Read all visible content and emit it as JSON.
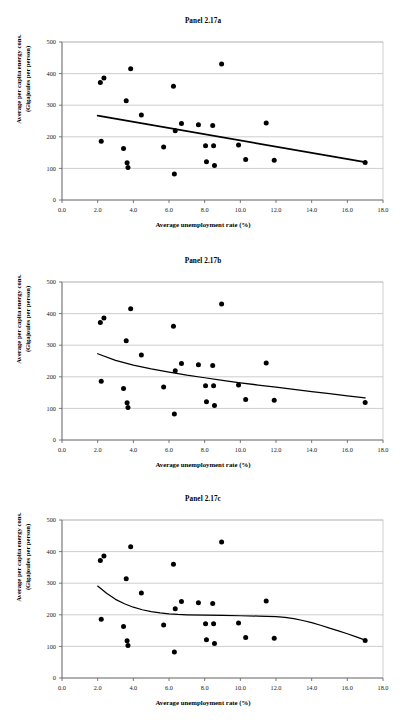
{
  "document": {
    "figure_label": "Panel 2.17",
    "panel_count": 3
  },
  "axes": {
    "xlabel": "Average unemployment rate (%)",
    "ylabel_line1": "Average per capita energy cons.",
    "ylabel_line2": "(Gigajoules per person)",
    "xticks": [
      "0.0",
      "2.0",
      "4.0",
      "6.0",
      "8.0",
      "10.0",
      "12.0",
      "14.0",
      "16.0",
      "18.0"
    ],
    "yticks": [
      "0",
      "100",
      "200",
      "300",
      "400",
      "500"
    ],
    "xlim": [
      0,
      18
    ],
    "ylim": [
      0,
      500
    ]
  },
  "chart_data": [
    {
      "type": "scatter",
      "title": "Panel 2.17a",
      "xlabel": "Average unemployment rate (%)",
      "ylabel": "Average per capita energy cons. (Gigajoules per person)",
      "xlim": [
        0,
        18
      ],
      "ylim": [
        0,
        500
      ],
      "xticks": [
        0,
        2,
        4,
        6,
        8,
        10,
        12,
        14,
        16,
        18
      ],
      "yticks": [
        0,
        100,
        200,
        300,
        400,
        500
      ],
      "grid": "horizontal",
      "legend": "none",
      "marker": "filled-circle",
      "marker_color": "#000000",
      "points": [
        {
          "x": 2.15,
          "y": 372
        },
        {
          "x": 2.35,
          "y": 386
        },
        {
          "x": 2.2,
          "y": 186
        },
        {
          "x": 3.45,
          "y": 163
        },
        {
          "x": 3.6,
          "y": 314
        },
        {
          "x": 3.65,
          "y": 118
        },
        {
          "x": 3.7,
          "y": 103
        },
        {
          "x": 3.85,
          "y": 415
        },
        {
          "x": 4.45,
          "y": 269
        },
        {
          "x": 5.7,
          "y": 168
        },
        {
          "x": 6.25,
          "y": 360
        },
        {
          "x": 6.3,
          "y": 82
        },
        {
          "x": 6.35,
          "y": 219
        },
        {
          "x": 6.7,
          "y": 242
        },
        {
          "x": 7.65,
          "y": 238
        },
        {
          "x": 8.05,
          "y": 172
        },
        {
          "x": 8.1,
          "y": 121
        },
        {
          "x": 8.45,
          "y": 236
        },
        {
          "x": 8.5,
          "y": 172
        },
        {
          "x": 8.55,
          "y": 109
        },
        {
          "x": 8.95,
          "y": 430
        },
        {
          "x": 9.9,
          "y": 174
        },
        {
          "x": 10.3,
          "y": 128
        },
        {
          "x": 11.45,
          "y": 244
        },
        {
          "x": 11.9,
          "y": 126
        },
        {
          "x": 17.0,
          "y": 119
        }
      ],
      "fit": {
        "kind": "linear",
        "description": "straight declining trend line",
        "path": [
          {
            "x": 2.0,
            "y": 267
          },
          {
            "x": 17.0,
            "y": 120
          }
        ]
      }
    },
    {
      "type": "scatter",
      "title": "Panel 2.17b",
      "xlabel": "Average unemployment rate (%)",
      "ylabel": "Average per capita energy cons. (Gigajoules per person)",
      "xlim": [
        0,
        18
      ],
      "ylim": [
        0,
        500
      ],
      "xticks": [
        0,
        2,
        4,
        6,
        8,
        10,
        12,
        14,
        16,
        18
      ],
      "yticks": [
        0,
        100,
        200,
        300,
        400,
        500
      ],
      "grid": "horizontal",
      "legend": "none",
      "marker": "filled-circle",
      "marker_color": "#000000",
      "points": [
        {
          "x": 2.15,
          "y": 372
        },
        {
          "x": 2.35,
          "y": 386
        },
        {
          "x": 2.2,
          "y": 186
        },
        {
          "x": 3.45,
          "y": 163
        },
        {
          "x": 3.6,
          "y": 314
        },
        {
          "x": 3.65,
          "y": 118
        },
        {
          "x": 3.7,
          "y": 103
        },
        {
          "x": 3.85,
          "y": 415
        },
        {
          "x": 4.45,
          "y": 269
        },
        {
          "x": 5.7,
          "y": 168
        },
        {
          "x": 6.25,
          "y": 360
        },
        {
          "x": 6.3,
          "y": 82
        },
        {
          "x": 6.35,
          "y": 219
        },
        {
          "x": 6.7,
          "y": 242
        },
        {
          "x": 7.65,
          "y": 238
        },
        {
          "x": 8.05,
          "y": 172
        },
        {
          "x": 8.1,
          "y": 121
        },
        {
          "x": 8.45,
          "y": 236
        },
        {
          "x": 8.5,
          "y": 172
        },
        {
          "x": 8.55,
          "y": 109
        },
        {
          "x": 8.95,
          "y": 430
        },
        {
          "x": 9.9,
          "y": 174
        },
        {
          "x": 10.3,
          "y": 128
        },
        {
          "x": 11.45,
          "y": 244
        },
        {
          "x": 11.9,
          "y": 126
        },
        {
          "x": 17.0,
          "y": 119
        }
      ],
      "fit": {
        "kind": "logarithmic",
        "description": "smooth concave-up decaying curve",
        "path": [
          {
            "x": 2.0,
            "y": 273
          },
          {
            "x": 3.0,
            "y": 252
          },
          {
            "x": 4.0,
            "y": 237
          },
          {
            "x": 5.0,
            "y": 225
          },
          {
            "x": 6.0,
            "y": 215
          },
          {
            "x": 7.0,
            "y": 205
          },
          {
            "x": 8.0,
            "y": 197
          },
          {
            "x": 9.0,
            "y": 189
          },
          {
            "x": 10.0,
            "y": 181
          },
          {
            "x": 11.0,
            "y": 174
          },
          {
            "x": 12.0,
            "y": 167
          },
          {
            "x": 13.0,
            "y": 160
          },
          {
            "x": 14.0,
            "y": 153
          },
          {
            "x": 15.0,
            "y": 147
          },
          {
            "x": 16.0,
            "y": 140
          },
          {
            "x": 17.0,
            "y": 133
          }
        ]
      }
    },
    {
      "type": "scatter",
      "title": "Panel 2.17c",
      "xlabel": "Average unemployment rate (%)",
      "ylabel": "Average per capita energy cons. (Gigajoules per person)",
      "xlim": [
        0,
        18
      ],
      "ylim": [
        0,
        500
      ],
      "xticks": [
        0,
        2,
        4,
        6,
        8,
        10,
        12,
        14,
        16,
        18
      ],
      "yticks": [
        0,
        100,
        200,
        300,
        400,
        500
      ],
      "grid": "horizontal",
      "legend": "none",
      "marker": "filled-circle",
      "marker_color": "#000000",
      "points": [
        {
          "x": 2.15,
          "y": 372
        },
        {
          "x": 2.35,
          "y": 386
        },
        {
          "x": 2.2,
          "y": 186
        },
        {
          "x": 3.45,
          "y": 163
        },
        {
          "x": 3.6,
          "y": 314
        },
        {
          "x": 3.65,
          "y": 118
        },
        {
          "x": 3.7,
          "y": 103
        },
        {
          "x": 3.85,
          "y": 415
        },
        {
          "x": 4.45,
          "y": 269
        },
        {
          "x": 5.7,
          "y": 168
        },
        {
          "x": 6.25,
          "y": 360
        },
        {
          "x": 6.3,
          "y": 82
        },
        {
          "x": 6.35,
          "y": 219
        },
        {
          "x": 6.7,
          "y": 242
        },
        {
          "x": 7.65,
          "y": 238
        },
        {
          "x": 8.05,
          "y": 172
        },
        {
          "x": 8.1,
          "y": 121
        },
        {
          "x": 8.45,
          "y": 236
        },
        {
          "x": 8.5,
          "y": 172
        },
        {
          "x": 8.55,
          "y": 109
        },
        {
          "x": 8.95,
          "y": 430
        },
        {
          "x": 9.9,
          "y": 174
        },
        {
          "x": 10.3,
          "y": 128
        },
        {
          "x": 11.45,
          "y": 244
        },
        {
          "x": 11.9,
          "y": 126
        },
        {
          "x": 17.0,
          "y": 119
        }
      ],
      "fit": {
        "kind": "cubic-polynomial",
        "description": "steep initial drop, long flat plateau, then decline at high end",
        "path": [
          {
            "x": 2.0,
            "y": 291
          },
          {
            "x": 2.5,
            "y": 268
          },
          {
            "x": 3.0,
            "y": 249
          },
          {
            "x": 3.5,
            "y": 235
          },
          {
            "x": 4.0,
            "y": 224
          },
          {
            "x": 4.5,
            "y": 216
          },
          {
            "x": 5.0,
            "y": 210
          },
          {
            "x": 5.5,
            "y": 206
          },
          {
            "x": 6.0,
            "y": 203
          },
          {
            "x": 6.5,
            "y": 201
          },
          {
            "x": 7.0,
            "y": 200
          },
          {
            "x": 8.0,
            "y": 199
          },
          {
            "x": 9.0,
            "y": 198
          },
          {
            "x": 10.0,
            "y": 197
          },
          {
            "x": 11.0,
            "y": 196
          },
          {
            "x": 12.0,
            "y": 194
          },
          {
            "x": 12.5,
            "y": 192
          },
          {
            "x": 13.0,
            "y": 188
          },
          {
            "x": 13.5,
            "y": 182
          },
          {
            "x": 14.0,
            "y": 175
          },
          {
            "x": 14.5,
            "y": 167
          },
          {
            "x": 15.0,
            "y": 158
          },
          {
            "x": 15.5,
            "y": 149
          },
          {
            "x": 16.0,
            "y": 140
          },
          {
            "x": 16.5,
            "y": 130
          },
          {
            "x": 17.0,
            "y": 120
          }
        ]
      }
    }
  ]
}
